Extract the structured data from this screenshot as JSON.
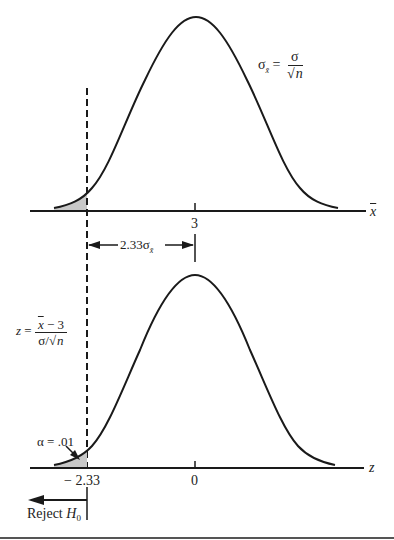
{
  "top_panel": {
    "formula": {
      "lhs_symbol": "σ",
      "lhs_subscript": "x̄",
      "equals": "=",
      "numerator": "σ",
      "sqrt_symbol": "√",
      "denominator_var": "n"
    },
    "axis_label": "x",
    "tick_label": "3",
    "distance_label_prefix": "2.33σ",
    "distance_label_subscript": "x̄"
  },
  "bottom_panel": {
    "formula": {
      "lhs": "z",
      "equals": "=",
      "numerator_var": "x",
      "numerator_rest": " − 3",
      "denominator": "σ/",
      "sqrt_symbol": "√",
      "denominator_var": "n"
    },
    "alpha_label": "α = .01",
    "axis_label": "z",
    "tick_labels": [
      "− 2.33",
      "0"
    ],
    "reject_label": "Reject ",
    "reject_var": "H",
    "reject_subscript": "0"
  },
  "colors": {
    "ink": "#1a1a1a",
    "shade": "#c8c8c8",
    "background": "#ffffff"
  }
}
